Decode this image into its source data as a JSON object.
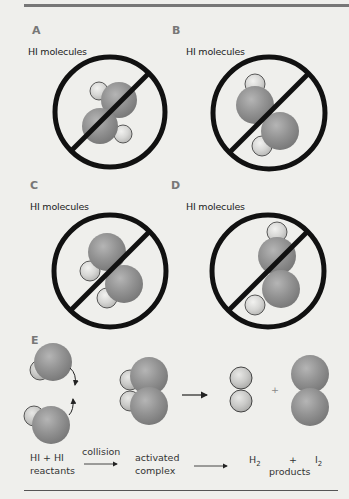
{
  "figure": {
    "panels": [
      {
        "letter": "A",
        "label": "HI molecules",
        "state": "prohibited"
      },
      {
        "letter": "B",
        "label": "HI molecules",
        "state": "prohibited"
      },
      {
        "letter": "C",
        "label": "HI molecules",
        "state": "prohibited"
      },
      {
        "letter": "D",
        "label": "HI molecules",
        "state": "prohibited"
      },
      {
        "letter": "E"
      }
    ],
    "reaction": {
      "reactants_line1": "HI + HI",
      "reactants_line2": "reactants",
      "step1_label": "collision",
      "intermediate_line1": "activated",
      "intermediate_line2": "complex",
      "product1": "H",
      "product1_sub": "2",
      "plus": "+",
      "product2": "I",
      "product2_sub": "2",
      "products_label": "products",
      "plus_between_molecules": "+"
    },
    "colors": {
      "background": "#efefec",
      "iodine_atom": "#8f8f8f",
      "hydrogen_atom": "#d8d8d6",
      "no_sign": "#111111",
      "panel_letter": "#777777"
    }
  }
}
